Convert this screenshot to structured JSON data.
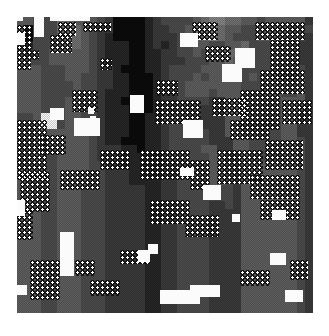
{
  "image": {
    "description": "Grayscale procedurally generated pixelated noise texture with dithering, dot-lattice patches and scattered white blobs",
    "palette": [
      "#0b0b0b",
      "#262626",
      "#3a3a3a",
      "#4c4c4c",
      "#5e5e5e",
      "#707070",
      "#858585",
      "#a0a0a0",
      "#c8c8c8",
      "#f8f8f8"
    ],
    "grid_size": 37,
    "rows": [
      "4433355444320000123333456655443444442",
      "4033355543220000122334556544334444333",
      "3033345543210000122234456543334443332",
      "3133345543211100121233443344533333322",
      "3233444443211100112233434455433333322",
      "4333444443211100112223334454433333322",
      "4443334443221000112333344444333333332",
      "4443334433221100012333434444343443342",
      "4443333433221100012234444444333443342",
      "4443333433211100012234443444333443342",
      "4443334433211000012233332244433334442",
      "4443334433211100012233322244433334432",
      "3349934433211100113333322244333334422",
      "3349934433211100112333322243333334422",
      "3344444443211100112333332244333334422",
      "3344444443211000112333332224433334432",
      "3343344443222110112333344224433334432",
      "3343344443222111112333334422433334432",
      "3333344443322111112233334432444444432",
      "4333344443322211112233334432444444432",
      "4333344443322211112233334432444444432",
      "4433344433322222112233333332444444432",
      "4433344433322222112233333332444444432",
      "4433344433322222112233332232444444432",
      "4443344433322222112233332222444444432",
      "4443344433322222112233332222444444432",
      "4443344433322222112233332222444444432",
      "4443344433322222112233332222444444432",
      "4443344433322222112233332222444444432",
      "4443344433322222112233332222444444432",
      "4443344433322222112233332222444444432",
      "4443344433322222112233332222444444432",
      "4443344433322222112233332222444444432",
      "4443344433322222112233332222444444432",
      "4443344433322222112233332222444444432",
      "4443344433322222112233332222444444432",
      "4443344433322222112233332222444444432"
    ],
    "white_blobs": [
      {
        "x": 17,
        "y": 17,
        "w": 6,
        "h": 4
      },
      {
        "x": 17,
        "y": 33,
        "w": 8,
        "h": 12
      },
      {
        "x": 34,
        "y": 17,
        "w": 10,
        "h": 20
      },
      {
        "x": 50,
        "y": 17,
        "w": 40,
        "h": 4
      },
      {
        "x": 50,
        "y": 108,
        "w": 14,
        "h": 12
      },
      {
        "x": 88,
        "y": 108,
        "w": 6,
        "h": 6
      },
      {
        "x": 130,
        "y": 95,
        "w": 14,
        "h": 18
      },
      {
        "x": 90,
        "y": 116,
        "w": 6,
        "h": 6
      },
      {
        "x": 74,
        "y": 118,
        "w": 26,
        "h": 18
      },
      {
        "x": 180,
        "y": 33,
        "w": 18,
        "h": 14
      },
      {
        "x": 235,
        "y": 48,
        "w": 20,
        "h": 20
      },
      {
        "x": 222,
        "y": 64,
        "w": 20,
        "h": 18
      },
      {
        "x": 183,
        "y": 120,
        "w": 20,
        "h": 18
      },
      {
        "x": 180,
        "y": 168,
        "w": 14,
        "h": 8
      },
      {
        "x": 203,
        "y": 185,
        "w": 18,
        "h": 15
      },
      {
        "x": 272,
        "y": 210,
        "w": 14,
        "h": 10
      },
      {
        "x": 270,
        "y": 253,
        "w": 16,
        "h": 12
      },
      {
        "x": 232,
        "y": 214,
        "w": 8,
        "h": 8
      },
      {
        "x": 60,
        "y": 232,
        "w": 14,
        "h": 44
      },
      {
        "x": 17,
        "y": 200,
        "w": 8,
        "h": 16
      },
      {
        "x": 138,
        "y": 250,
        "w": 12,
        "h": 12
      },
      {
        "x": 148,
        "y": 244,
        "w": 10,
        "h": 10
      },
      {
        "x": 160,
        "y": 290,
        "w": 40,
        "h": 14
      },
      {
        "x": 190,
        "y": 285,
        "w": 30,
        "h": 12
      },
      {
        "x": 285,
        "y": 290,
        "w": 18,
        "h": 12
      },
      {
        "x": 17,
        "y": 285,
        "w": 10,
        "h": 10
      }
    ],
    "dot_patches": [
      {
        "x": 17,
        "y": 25,
        "w": 14,
        "h": 45
      },
      {
        "x": 27,
        "y": 50,
        "w": 12,
        "h": 10
      },
      {
        "x": 58,
        "y": 22,
        "w": 18,
        "h": 14
      },
      {
        "x": 50,
        "y": 35,
        "w": 22,
        "h": 18
      },
      {
        "x": 83,
        "y": 22,
        "w": 28,
        "h": 10
      },
      {
        "x": 100,
        "y": 58,
        "w": 12,
        "h": 12
      },
      {
        "x": 72,
        "y": 90,
        "w": 26,
        "h": 22
      },
      {
        "x": 156,
        "y": 80,
        "w": 22,
        "h": 16
      },
      {
        "x": 155,
        "y": 100,
        "w": 46,
        "h": 24
      },
      {
        "x": 192,
        "y": 22,
        "w": 26,
        "h": 18
      },
      {
        "x": 205,
        "y": 46,
        "w": 26,
        "h": 16
      },
      {
        "x": 255,
        "y": 22,
        "w": 50,
        "h": 18
      },
      {
        "x": 270,
        "y": 40,
        "w": 30,
        "h": 40
      },
      {
        "x": 260,
        "y": 70,
        "w": 45,
        "h": 24
      },
      {
        "x": 240,
        "y": 90,
        "w": 40,
        "h": 40
      },
      {
        "x": 282,
        "y": 100,
        "w": 30,
        "h": 24
      },
      {
        "x": 212,
        "y": 98,
        "w": 36,
        "h": 18
      },
      {
        "x": 230,
        "y": 120,
        "w": 40,
        "h": 20
      },
      {
        "x": 265,
        "y": 140,
        "w": 38,
        "h": 30
      },
      {
        "x": 217,
        "y": 150,
        "w": 46,
        "h": 34
      },
      {
        "x": 17,
        "y": 120,
        "w": 30,
        "h": 60
      },
      {
        "x": 40,
        "y": 135,
        "w": 26,
        "h": 20
      },
      {
        "x": 20,
        "y": 172,
        "w": 30,
        "h": 40
      },
      {
        "x": 60,
        "y": 170,
        "w": 40,
        "h": 20
      },
      {
        "x": 100,
        "y": 150,
        "w": 30,
        "h": 20
      },
      {
        "x": 140,
        "y": 150,
        "w": 50,
        "h": 30
      },
      {
        "x": 190,
        "y": 160,
        "w": 20,
        "h": 30
      },
      {
        "x": 250,
        "y": 175,
        "w": 50,
        "h": 24
      },
      {
        "x": 260,
        "y": 200,
        "w": 40,
        "h": 20
      },
      {
        "x": 150,
        "y": 200,
        "w": 40,
        "h": 24
      },
      {
        "x": 185,
        "y": 215,
        "w": 34,
        "h": 22
      },
      {
        "x": 30,
        "y": 260,
        "w": 30,
        "h": 40
      },
      {
        "x": 17,
        "y": 210,
        "w": 16,
        "h": 30
      },
      {
        "x": 75,
        "y": 260,
        "w": 20,
        "h": 16
      },
      {
        "x": 90,
        "y": 280,
        "w": 30,
        "h": 16
      },
      {
        "x": 240,
        "y": 270,
        "w": 30,
        "h": 16
      },
      {
        "x": 290,
        "y": 260,
        "w": 18,
        "h": 20
      },
      {
        "x": 120,
        "y": 250,
        "w": 30,
        "h": 14
      }
    ]
  }
}
